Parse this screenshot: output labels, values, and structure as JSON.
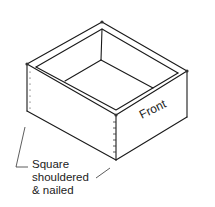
{
  "figure": {
    "front_label": "Front",
    "callout_lines": [
      "Square",
      "shouldered",
      "& nailed"
    ]
  }
}
